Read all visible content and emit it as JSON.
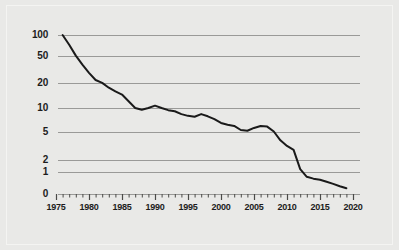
{
  "chart_data": {
    "type": "line",
    "title": "",
    "subtitle": "",
    "xlabel": "",
    "ylabel": "",
    "scale": "log",
    "grid": true,
    "legend": false,
    "xlim": [
      1975,
      2020
    ],
    "ylim": [
      0.4,
      140
    ],
    "x_ticks": [
      "1975",
      "1980",
      "1985",
      "1990",
      "1995",
      "2000",
      "2005",
      "2010",
      "2015",
      "2020"
    ],
    "y_ticks": [
      "100",
      "50",
      "20",
      "10",
      "5",
      "2",
      "1",
      "0"
    ],
    "y_tick_values": [
      100,
      50,
      20,
      10,
      5,
      2,
      1,
      0
    ],
    "minor_ticks_per_interval": 5,
    "series": [
      {
        "name": "value",
        "color": "#1a1a1a",
        "x": [
          1976,
          1977,
          1978,
          1979,
          1980,
          1981,
          1982,
          1983,
          1984,
          1985,
          1986,
          1987,
          1988,
          1989,
          1990,
          1991,
          1992,
          1993,
          1994,
          1995,
          1996,
          1997,
          1998,
          1999,
          2000,
          2001,
          2002,
          2003,
          2004,
          2005,
          2006,
          2007,
          2008,
          2009,
          2010,
          2011,
          2012,
          2013,
          2014,
          2015,
          2016,
          2017,
          2018,
          2019
        ],
        "values": [
          100,
          72,
          50,
          37,
          28,
          22,
          20,
          17,
          15,
          13.5,
          10.8,
          8.6,
          8.1,
          8.6,
          9.3,
          8.6,
          8.0,
          7.7,
          7.0,
          6.6,
          6.4,
          7.0,
          6.5,
          5.9,
          5.2,
          4.9,
          4.7,
          4.1,
          4.0,
          4.4,
          4.7,
          4.6,
          3.9,
          2.9,
          2.4,
          2.1,
          1.1,
          0.85,
          0.8,
          0.77,
          0.72,
          0.67,
          0.62,
          0.58
        ]
      }
    ]
  },
  "axis": {
    "y_labels": [
      "100",
      "50",
      "20",
      "10",
      "5",
      "2",
      "1",
      "0"
    ],
    "x_labels": [
      "1975",
      "1980",
      "1985",
      "1990",
      "1995",
      "2000",
      "2005",
      "2010",
      "2015",
      "2020"
    ]
  },
  "colors": {
    "background": "#e9e9e7",
    "grid": "#9a9a98",
    "line": "#1a1a1a",
    "text": "#1c1c1c",
    "border": "#f4f4f2"
  }
}
